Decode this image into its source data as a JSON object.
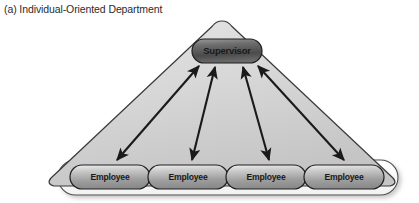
{
  "figure": {
    "caption": "(a) Individual-Oriented Department",
    "type": "organizational-diagram",
    "shape": "triangle",
    "colors": {
      "page_background": "#ffffff",
      "caption_text": "#2b2b2b",
      "triangle_fill_light": "#dcdcdc",
      "triangle_fill_dark": "#c3c3c3",
      "triangle_outline": "#3a3a3a",
      "base_capsule_fill": "#fbfbfb",
      "base_capsule_outline": "#4a4a4a",
      "supervisor_fill_dark": "#4e4e4e",
      "supervisor_fill_light": "#8f8f8f",
      "supervisor_outline": "#1f1f1f",
      "employee_fill_light": "#e8e8e8",
      "employee_fill_dark": "#9a9a9a",
      "employee_outline": "#1f1f1f",
      "arrow_color": "#1a1a1a",
      "node_text": "#1a1a1a"
    }
  },
  "nodes": {
    "supervisor": {
      "label": "Supervisor",
      "role": "supervisor",
      "cx": 227,
      "cy": 51
    },
    "employees": [
      {
        "label": "Employee",
        "role": "employee",
        "cx": 110,
        "cy": 177
      },
      {
        "label": "Employee",
        "role": "employee",
        "cx": 188,
        "cy": 177
      },
      {
        "label": "Employee",
        "role": "employee",
        "cx": 266,
        "cy": 177
      },
      {
        "label": "Employee",
        "role": "employee",
        "cx": 344,
        "cy": 177
      }
    ]
  },
  "connections": [
    {
      "from": "employee-1",
      "to": "supervisor",
      "style": "double-headed-arrow"
    },
    {
      "from": "employee-2",
      "to": "supervisor",
      "style": "double-headed-arrow"
    },
    {
      "from": "employee-3",
      "to": "supervisor",
      "style": "double-headed-arrow"
    },
    {
      "from": "employee-4",
      "to": "supervisor",
      "style": "double-headed-arrow"
    }
  ]
}
